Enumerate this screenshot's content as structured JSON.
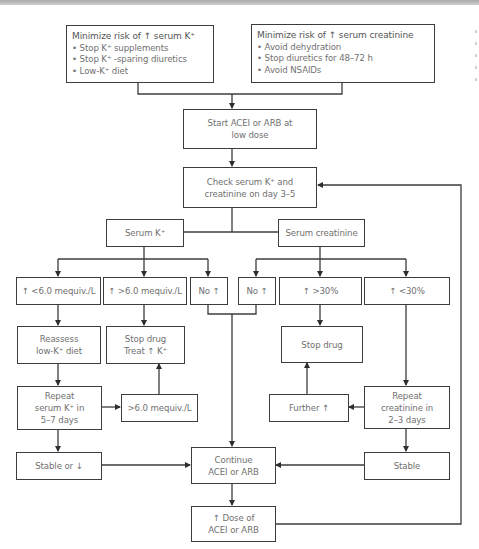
{
  "diagram": {
    "type": "flowchart",
    "top_boxes": {
      "potassium": {
        "title": "Minimize risk of ↑ serum K⁺",
        "bullets": [
          "• Stop K⁺ supplements",
          "• Stop K⁺ -sparing diuretics",
          "• Low-K⁺ diet"
        ]
      },
      "creatinine": {
        "title": "Minimize risk of ↑ serum creatinine",
        "bullets": [
          "• Avoid dehydration",
          "• Stop diuretics for 48–72 h",
          "• Avoid NSAIDs"
        ]
      }
    },
    "start": [
      "Start ACEI or ARB at",
      "low dose"
    ],
    "check": [
      "Check serum K⁺ and",
      "creatinine on day 3–5"
    ],
    "branches": {
      "serum_k": "Serum K⁺",
      "serum_creatinine": "Serum creatinine"
    },
    "k_outcomes": {
      "lt6": "↑ <6.0 mequiv./L",
      "gt6": "↑ >6.0 mequiv./L",
      "no": "No ↑"
    },
    "cr_outcomes": {
      "no": "No ↑",
      "gt30": "↑ >30%",
      "lt30": "↑ <30%"
    },
    "k_actions": {
      "reassess": [
        "Reassess",
        "low-K⁺ diet"
      ],
      "stop_treat": [
        "Stop drug",
        "Treat ↑ K⁺"
      ],
      "repeat": [
        "Repeat",
        "serum K⁺ in",
        "5–7 days"
      ],
      "gt6_recheck": ">6.0 mequiv./L",
      "stable": "Stable or ↓"
    },
    "cr_actions": {
      "stop": "Stop drug",
      "further": "Further ↑",
      "repeat": [
        "Repeat",
        "creatinine in",
        "2–3 days"
      ],
      "stable": "Stable"
    },
    "continue": [
      "Continue",
      "ACEI or ARB"
    ],
    "increase_dose": [
      "↑ Dose of",
      "ACEI or ARB"
    ],
    "colors": {
      "line": "#3c3c3c",
      "text": "#707070",
      "background": "#ffffff"
    }
  }
}
